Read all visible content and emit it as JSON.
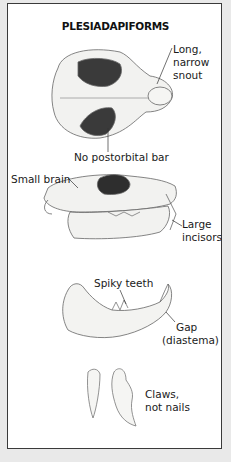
{
  "figure": {
    "title": "PLESIADAPIFORMS",
    "labels": {
      "snout": [
        "Long,",
        "narrow",
        "snout"
      ],
      "postorbital": "No postorbital bar",
      "brain": "Small brain",
      "incisors": [
        "Large",
        "incisors"
      ],
      "teeth": "Spiky teeth",
      "gap": [
        "Gap",
        "(diastema)"
      ],
      "claws": [
        "Claws,",
        "not nails"
      ]
    },
    "illustrations": [
      "skull-top-view",
      "skull-side-view",
      "lower-jaw",
      "claw-bones"
    ]
  },
  "colors": {
    "background": "#e9e9e9",
    "panel": "#ffffff",
    "border": "#3a3a3a"
  }
}
